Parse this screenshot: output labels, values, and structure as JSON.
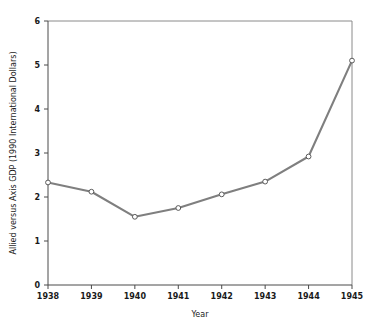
{
  "chart_data": {
    "type": "line",
    "title": "",
    "xlabel": "Year",
    "ylabel": "Allied versus Axis GDP (1990 International Dollars)",
    "categories": [
      "1938",
      "1939",
      "1940",
      "1941",
      "1942",
      "1943",
      "1944",
      "1945"
    ],
    "x": [
      1938,
      1939,
      1940,
      1941,
      1942,
      1943,
      1944,
      1945
    ],
    "values": [
      2.33,
      2.12,
      1.55,
      1.75,
      2.06,
      2.35,
      2.92,
      5.1
    ],
    "series": [
      {
        "name": "Allied versus Axis GDP ratio",
        "values": [
          2.33,
          2.12,
          1.55,
          1.75,
          2.06,
          2.35,
          2.92,
          5.1
        ]
      }
    ],
    "xlim": [
      1938,
      1945
    ],
    "ylim": [
      0,
      6
    ],
    "y_ticks": [
      "0",
      "1",
      "2",
      "3",
      "4",
      "5",
      "6"
    ],
    "y_tick_values": [
      0,
      1,
      2,
      3,
      4,
      5,
      6
    ],
    "x_ticks": [
      "1938",
      "1939",
      "1940",
      "1941",
      "1942",
      "1943",
      "1944",
      "1945"
    ],
    "grid": false,
    "legend": "none",
    "marker": "open-circle",
    "line_color": "#7f7f7f",
    "marker_fill": "#ffffff",
    "marker_stroke": "#5a5a5a",
    "axis_color": "#4a4a4a",
    "frame_color": "#8a8a8a",
    "background": "#ffffff"
  },
  "axes": {
    "y_title": "Allied versus Axis GDP (1990 International Dollars)",
    "x_title": "Year"
  }
}
